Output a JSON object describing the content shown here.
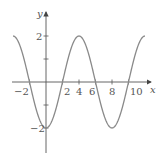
{
  "chart_data": {
    "type": "line",
    "title": "",
    "xlabel": "x",
    "ylabel": "y",
    "function": "y = -2 cos(pi x / 4)",
    "xlim": [
      -4,
      12
    ],
    "ylim": [
      -3,
      3
    ],
    "x_ticks": [
      -2,
      2,
      4,
      6,
      8,
      10
    ],
    "x_tick_labels": [
      "−2",
      "2",
      "4",
      "6",
      "8",
      "10"
    ],
    "y_ticks": [
      -2,
      -1,
      1,
      2
    ],
    "y_tick_labels": [
      "−2",
      "2"
    ],
    "grid": false,
    "legend": null,
    "series": [
      {
        "name": "curve",
        "color": "#808080",
        "x": [
          -4,
          -3,
          -2,
          -1,
          0,
          1,
          2,
          3,
          4,
          5,
          6,
          7,
          8,
          9,
          10,
          11,
          12
        ],
        "values": [
          2,
          1.414,
          0,
          -1.414,
          -2,
          -1.414,
          0,
          1.414,
          2,
          1.414,
          0,
          -1.414,
          -2,
          -1.414,
          0,
          1.414,
          2
        ]
      }
    ]
  },
  "labels": {
    "x_axis": "x",
    "y_axis": "y",
    "xt": [
      "−2",
      "2",
      "4",
      "6",
      "8",
      "10"
    ],
    "yt_top": "2",
    "yt_bottom": "−2"
  }
}
